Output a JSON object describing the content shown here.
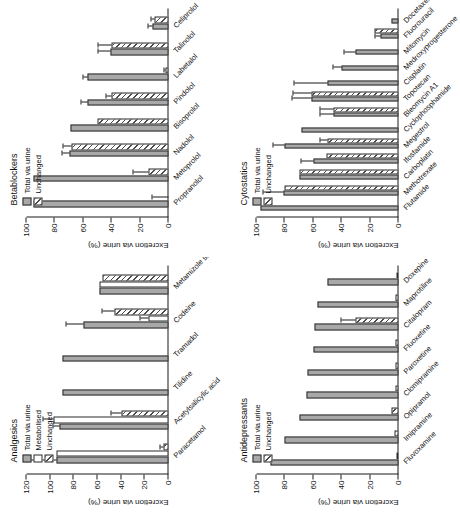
{
  "figure": {
    "axis_title": "Excretion via urine (%)",
    "legend_total": "Total via urine",
    "legend_metabolised": "Metabolised",
    "legend_unchanged": "Unchanged"
  },
  "chart_data": [
    {
      "type": "bar",
      "title": "Betablockers",
      "xlabel": "",
      "ylabel": "Excretion via urine (%)",
      "ylim": [
        0,
        100
      ],
      "yticks": [
        0,
        20,
        40,
        60,
        80,
        100
      ],
      "grid": false,
      "legend_position": "top-left",
      "categories": [
        "Propranolol",
        "Metoprolol",
        "Nadolol",
        "Bisoprolol",
        "Pindolol",
        "Labetalol",
        "Talinolol",
        "Celiprolol"
      ],
      "series": [
        {
          "name": "Total via urine",
          "values": [
            95,
            95,
            70,
            69,
            57,
            57,
            41,
            11
          ],
          "errors": [
            0,
            0,
            5,
            0,
            4,
            3,
            8,
            3
          ]
        },
        {
          "name": "Unchanged",
          "values": [
            0,
            14,
            68,
            50,
            40,
            2,
            40,
            10
          ],
          "errors": [
            11,
            11,
            6,
            0,
            4,
            1,
            9,
            2
          ]
        }
      ]
    },
    {
      "type": "bar",
      "title": "Cytostatics",
      "xlabel": "",
      "ylabel": "Excretion via urine (%)",
      "ylim": [
        0,
        100
      ],
      "yticks": [
        0,
        20,
        40,
        60,
        80,
        100
      ],
      "grid": false,
      "legend_position": "top-left",
      "categories": [
        "Flutamide",
        "Methotrexate",
        "Carboplatin",
        "Ifosfamide",
        "Megestrol",
        "Cyclophosphamide",
        "Bleomycin A1",
        "Topotecan",
        "Cisplatin",
        "Medroxyprogesterone",
        "Mitomycin",
        "Fluorouracil",
        "Docetaxel"
      ],
      "series": [
        {
          "name": "Total via urine",
          "values": [
            97,
            81,
            70,
            60,
            80,
            68,
            46,
            61,
            50,
            40,
            30,
            13,
            5
          ],
          "errors": [
            0,
            14,
            0,
            8,
            8,
            0,
            9,
            14,
            23,
            6,
            8,
            3,
            0
          ]
        },
        {
          "name": "Unchanged",
          "values": [
            0,
            80,
            70,
            51,
            50,
            0,
            46,
            61,
            0,
            0,
            0,
            17,
            0
          ],
          "errors": [
            0,
            0,
            0,
            0,
            5,
            0,
            9,
            13,
            0,
            0,
            0,
            0,
            0
          ]
        }
      ]
    },
    {
      "type": "bar",
      "title": "Analgesics",
      "xlabel": "",
      "ylabel": "Excretion via urine (%)",
      "ylim": [
        0,
        120
      ],
      "yticks": [
        0,
        20,
        40,
        60,
        80,
        100,
        120
      ],
      "grid": false,
      "legend_position": "top-left",
      "categories": [
        "Paracetamol",
        "Acetylsalicylic acid",
        "Tilidine",
        "Tramadol",
        "Codeine",
        "Metamizole sodium"
      ],
      "series": [
        {
          "name": "Total via urine",
          "values": [
            95,
            92,
            90,
            90,
            72,
            58
          ],
          "errors": [
            24,
            5,
            0,
            0,
            14,
            0
          ]
        },
        {
          "name": "Metabolised",
          "values": [
            95,
            97,
            0,
            0,
            17,
            58
          ],
          "errors": [
            0,
            9,
            0,
            0,
            7,
            0
          ]
        },
        {
          "name": "Unchanged",
          "values": [
            4,
            40,
            0,
            0,
            46,
            56
          ],
          "errors": [
            3,
            8,
            0,
            0,
            10,
            0
          ]
        }
      ]
    },
    {
      "type": "bar",
      "title": "Antidepressants",
      "xlabel": "",
      "ylabel": "Excretion via urine (%)",
      "ylim": [
        0,
        100
      ],
      "yticks": [
        0,
        20,
        40,
        60,
        80,
        100
      ],
      "grid": false,
      "legend_position": "top-left",
      "categories": [
        "Fluvoxamine",
        "Imipramine",
        "Opipramol",
        "Clomipramine",
        "Paroxetine",
        "Fluoxetine",
        "Citalopram",
        "Maprotiline",
        "Doxepine"
      ],
      "series": [
        {
          "name": "Total via urine",
          "values": [
            90,
            80,
            70,
            65,
            64,
            60,
            59,
            57,
            50
          ],
          "errors": [
            0,
            0,
            0,
            0,
            0,
            0,
            0,
            0,
            0
          ]
        },
        {
          "name": "Unchanged",
          "values": [
            1,
            3,
            5,
            2,
            2,
            2,
            30,
            2,
            1
          ],
          "errors": [
            0,
            0,
            0,
            0,
            0,
            0,
            10,
            0,
            0
          ]
        }
      ]
    }
  ]
}
